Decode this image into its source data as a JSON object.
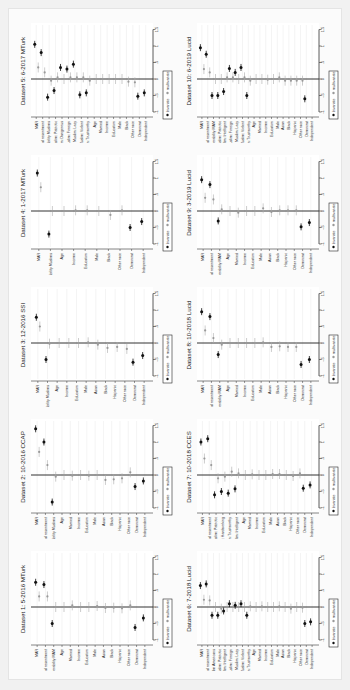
{
  "figure": {
    "orientation": "rotated 90deg counter-clockwise",
    "legend": {
      "bivariate": "bivariate",
      "multivariate": "multivariate"
    },
    "value_ticks": [
      "-1",
      "-.5",
      "0",
      ".5",
      "1",
      "1.5"
    ]
  },
  "chart_data": [
    {
      "type": "scatter",
      "title": "Dataset 1: 5-2016 MTurk",
      "position": {
        "col": 0,
        "row": 4
      },
      "ylim": [
        -1,
        1.5
      ],
      "categories": [
        "MAR",
        "Racial resentment",
        "Favorability MAM",
        "Age",
        "Married",
        "Income",
        "Education",
        "Male",
        "Asian",
        "Black",
        "Hispanic",
        "Other race",
        "Democrat",
        "Independent"
      ],
      "series": [
        {
          "name": "bivariate",
          "values": [
            0.75,
            0.68,
            -0.5,
            null,
            null,
            null,
            null,
            null,
            null,
            null,
            null,
            null,
            -0.62,
            -0.33
          ]
        },
        {
          "name": "multivariate",
          "values": [
            0.32,
            0.32,
            0.0,
            0.0,
            0.05,
            0.0,
            0.0,
            0.03,
            -0.03,
            -0.02,
            -0.04,
            0.05,
            null,
            null
          ]
        }
      ]
    },
    {
      "type": "scatter",
      "title": "Dataset 2: 10-2016 CCAP",
      "position": {
        "col": 0,
        "row": 3
      },
      "ylim": [
        -1,
        1.5
      ],
      "categories": [
        "MAR",
        "Racial resentment",
        "Favorability Muslims",
        "Age",
        "Married",
        "Income",
        "Education",
        "Male",
        "Asian",
        "Black",
        "Hispanic",
        "Other race",
        "Democrat",
        "Independent"
      ],
      "series": [
        {
          "name": "bivariate",
          "values": [
            1.4,
            1.0,
            -0.82,
            null,
            null,
            null,
            null,
            null,
            null,
            null,
            null,
            null,
            -0.35,
            -0.18
          ]
        },
        {
          "name": "multivariate",
          "values": [
            0.7,
            0.3,
            -0.05,
            0.0,
            -0.02,
            0.0,
            -0.02,
            0.0,
            -0.15,
            -0.13,
            -0.1,
            0.08,
            null,
            null
          ]
        }
      ]
    },
    {
      "type": "scatter",
      "title": "Dataset 3: 12-2016 SSI",
      "position": {
        "col": 0,
        "row": 2
      },
      "ylim": [
        -1,
        1.5
      ],
      "categories": [
        "MAR",
        "Favorability Muslims",
        "Age",
        "Income",
        "Education",
        "Male",
        "Asian",
        "Black",
        "Hispanic",
        "Other race",
        "Democrat",
        "Independent"
      ],
      "series": [
        {
          "name": "bivariate",
          "values": [
            0.78,
            -0.5,
            null,
            null,
            null,
            null,
            null,
            null,
            null,
            null,
            -0.58,
            -0.38
          ]
        },
        {
          "name": "multivariate",
          "values": [
            0.5,
            -0.02,
            0.0,
            0.0,
            0.0,
            0.02,
            -0.05,
            -0.15,
            -0.12,
            -0.18,
            null,
            null
          ]
        }
      ]
    },
    {
      "type": "scatter",
      "title": "Dataset 4: 1-2017 MTurk",
      "position": {
        "col": 0,
        "row": 1
      },
      "ylim": [
        -1,
        1.5
      ],
      "categories": [
        "MAR",
        "Favorability Muslims",
        "Age",
        "Income",
        "Education",
        "Male",
        "Black",
        "Other race",
        "Democrat",
        "Independent"
      ],
      "series": [
        {
          "name": "bivariate",
          "values": [
            1.15,
            -0.7,
            null,
            null,
            null,
            null,
            null,
            null,
            -0.5,
            -0.32
          ]
        },
        {
          "name": "multivariate",
          "values": [
            0.72,
            0.0,
            0.0,
            0.02,
            0.02,
            0.0,
            -0.12,
            0.02,
            null,
            null
          ]
        }
      ]
    },
    {
      "type": "scatter",
      "title": "Dataset 5: 6-2017 MTurk",
      "position": {
        "col": 0,
        "row": 0
      },
      "ylim": [
        -1,
        1.5
      ],
      "categories": [
        "MAR",
        "Racial resentment",
        "Favorability Muslims",
        "Muslim: Patriotic",
        "Muslim: Dangerous",
        "Muslim: Foreign",
        "Muslim: Lazy",
        "Muslim: Violent",
        "Muslim: Trustworthy",
        "Age",
        "Married",
        "Income",
        "Education",
        "Male",
        "Black",
        "Other race",
        "Democrat",
        "Independent"
      ],
      "series": [
        {
          "name": "bivariate",
          "values": [
            1.05,
            0.8,
            -0.55,
            -0.35,
            0.35,
            0.3,
            0.45,
            -0.48,
            -0.42,
            null,
            null,
            null,
            null,
            null,
            null,
            null,
            -0.52,
            -0.42
          ]
        },
        {
          "name": "multivariate",
          "values": [
            0.35,
            0.2,
            -0.05,
            0.05,
            0.0,
            0.05,
            0.05,
            0.05,
            -0.05,
            0.0,
            0.0,
            0.0,
            0.0,
            0.0,
            -0.08,
            -0.1,
            null,
            null
          ]
        }
      ]
    },
    {
      "type": "scatter",
      "title": "Dataset 6: 7-2018 Lucid",
      "position": {
        "col": 1,
        "row": 4
      },
      "ylim": [
        -1,
        1.5
      ],
      "categories": [
        "MAR",
        "Racial resentment",
        "Favorability Muslim Americans",
        "Muslim: Patriotic",
        "Muslim: Intelligent",
        "Muslim: Foreign",
        "Muslim: Lazy",
        "Muslim: Violent",
        "Muslim: Trustworthy",
        "Age",
        "Married",
        "Income",
        "Education",
        "Male",
        "Asian",
        "Black",
        "Hispanic",
        "Other race",
        "Democrat",
        "Independent"
      ],
      "series": [
        {
          "name": "bivariate",
          "values": [
            0.65,
            0.7,
            -0.25,
            -0.25,
            -0.12,
            0.1,
            0.05,
            0.1,
            -0.25,
            null,
            null,
            null,
            null,
            null,
            null,
            null,
            null,
            null,
            -0.5,
            -0.45
          ]
        },
        {
          "name": "multivariate",
          "values": [
            0.22,
            0.2,
            0.0,
            -0.05,
            0.0,
            0.0,
            0.0,
            0.0,
            0.02,
            0.0,
            0.02,
            0.0,
            0.0,
            0.02,
            0.0,
            -0.05,
            0.0,
            -0.02,
            null,
            null
          ]
        }
      ]
    },
    {
      "type": "scatter",
      "title": "Dataset 7: 10-2018 CCES",
      "position": {
        "col": 1,
        "row": 3
      },
      "ylim": [
        -1,
        1.5
      ],
      "categories": [
        "MAR",
        "Racial resentment",
        "Muslim: Patriotic",
        "Muslim: Hardworking",
        "Muslim: Trustworthy",
        "Muslim: Intelligent",
        "Age",
        "Married",
        "Income",
        "Education",
        "Male",
        "Asian",
        "Black",
        "Hispanic",
        "Other race",
        "Democrat",
        "Independent"
      ],
      "series": [
        {
          "name": "bivariate",
          "values": [
            1.0,
            1.1,
            -0.6,
            -0.5,
            -0.55,
            -0.42,
            null,
            null,
            null,
            null,
            null,
            null,
            null,
            null,
            null,
            -0.4,
            -0.3
          ]
        },
        {
          "name": "multivariate",
          "values": [
            0.5,
            0.3,
            -0.1,
            -0.05,
            0.1,
            0.05,
            0.0,
            0.02,
            0.0,
            0.0,
            0.03,
            0.03,
            0.0,
            -0.03,
            0.05,
            null,
            null
          ]
        }
      ]
    },
    {
      "type": "scatter",
      "title": "Dataset 8: 10-2018 Lucid",
      "position": {
        "col": 1,
        "row": 2
      },
      "ylim": [
        -1,
        1.5
      ],
      "categories": [
        "MAR",
        "Racial resentment",
        "Favorability MAM",
        "Age",
        "Married",
        "Income",
        "Education",
        "Male",
        "Asian",
        "Black",
        "Hispanic",
        "Other race",
        "Democrat",
        "Independent"
      ],
      "series": [
        {
          "name": "bivariate",
          "values": [
            0.95,
            0.8,
            -0.35,
            null,
            null,
            null,
            null,
            null,
            null,
            null,
            null,
            null,
            -0.65,
            -0.5
          ]
        },
        {
          "name": "multivariate",
          "values": [
            0.38,
            0.15,
            -0.05,
            0.0,
            0.0,
            0.0,
            0.0,
            0.02,
            -0.12,
            -0.1,
            -0.12,
            -0.12,
            null,
            null
          ]
        }
      ]
    },
    {
      "type": "scatter",
      "title": "Dataset 9: 3-2019 Lucid",
      "position": {
        "col": 1,
        "row": 1
      },
      "ylim": [
        -1,
        1.5
      ],
      "categories": [
        "MAR",
        "Racial resentment",
        "Favorability MAM",
        "Age",
        "Married",
        "Income",
        "Education",
        "Male",
        "Asian",
        "Black",
        "Hispanic",
        "Other race",
        "Democrat",
        "Independent"
      ],
      "series": [
        {
          "name": "bivariate",
          "values": [
            0.95,
            0.8,
            -0.3,
            null,
            null,
            null,
            null,
            null,
            null,
            null,
            null,
            null,
            -0.48,
            -0.35
          ]
        },
        {
          "name": "multivariate",
          "values": [
            0.4,
            0.35,
            0.05,
            0.0,
            -0.05,
            0.0,
            0.0,
            0.08,
            -0.03,
            0.02,
            0.02,
            0.02,
            null,
            null
          ]
        }
      ]
    },
    {
      "type": "scatter",
      "title": "Dataset 10: 6-2019 Lucid",
      "position": {
        "col": 1,
        "row": 0
      },
      "ylim": [
        -1,
        1.5
      ],
      "categories": [
        "MAR",
        "Racial resentment",
        "Favorability MAM",
        "Muslim: Patriotic",
        "Muslim: Intelligent",
        "Muslim: Foreign",
        "Muslim: Lazy",
        "Muslim: Violent",
        "Muslim: Trustworthy",
        "Age",
        "Married",
        "Income",
        "Education",
        "Male",
        "Asian",
        "Black",
        "Hispanic",
        "Other race",
        "Democrat",
        "Independent"
      ],
      "series": [
        {
          "name": "bivariate",
          "values": [
            0.95,
            0.75,
            -0.5,
            -0.5,
            -0.38,
            0.32,
            0.2,
            0.35,
            -0.5,
            null,
            null,
            null,
            null,
            null,
            null,
            null,
            null,
            null,
            -0.6,
            null
          ]
        },
        {
          "name": "multivariate",
          "values": [
            0.3,
            0.2,
            0.0,
            0.0,
            0.05,
            0.05,
            0.0,
            0.05,
            -0.05,
            0.0,
            0.0,
            -0.02,
            0.0,
            0.05,
            -0.05,
            -0.05,
            -0.05,
            -0.05,
            null,
            null
          ]
        }
      ]
    }
  ]
}
